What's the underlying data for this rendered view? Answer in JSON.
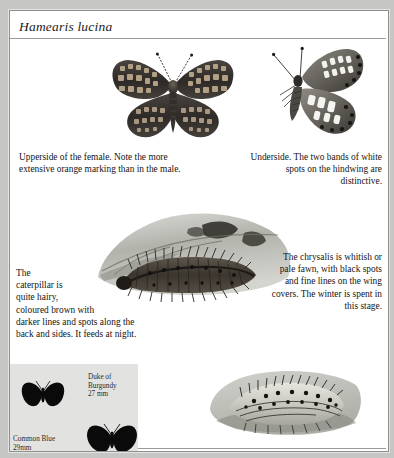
{
  "page": {
    "species_title": "Hamearis lucina",
    "background_color": "#c6c6c4",
    "sheet_color": "#ffffff",
    "rule_color": "#9a9a9a"
  },
  "captions": {
    "upperside": "Upperside of the female. Note the more extensive orange marking than in the male.",
    "underside": "Underside. The two bands of white spots on the hindwing are distinctive.",
    "chrysalis": "The chrysalis is whitish or pale fawn, with black spots and fine lines on the wing covers. The winter is spent in this stage.",
    "caterpillar_lines": [
      "The",
      "caterpillar is",
      "quite hairy,",
      "coloured brown with",
      "darker lines and spots along the",
      "back and sides. It feeds at night."
    ]
  },
  "illustrations": {
    "upperside": "butterfly-upperside-illustration",
    "underside": "butterfly-underside-illustration",
    "caterpillar": "caterpillar-on-leaf-illustration",
    "chrysalis": "chrysalis-illustration"
  },
  "size_panel": {
    "background_color": "#e2e2e0",
    "entries": [
      {
        "name_line1": "Duke of",
        "name_line2": "Burgundy",
        "size": "27 mm"
      },
      {
        "name_line1": "Common Blue",
        "name_line2": "",
        "size": "29mm"
      }
    ],
    "duke_label": "Duke of\nBurgundy\n27 mm",
    "common_label": "Common Blue\n29mm"
  }
}
